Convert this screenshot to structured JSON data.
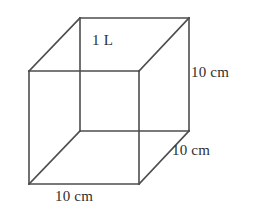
{
  "figure": {
    "name": "cube-volume-diagram",
    "background_color": "#ffffff",
    "line_color": "#4d4d4d",
    "text_color": "#2e2e2e"
  },
  "labels": {
    "volume": "1 L",
    "height": "10 cm",
    "depth": "10 cm",
    "width": "10 cm"
  },
  "geometry": {
    "front_face": {
      "top_left": [
        29,
        71
      ],
      "top_right": [
        139,
        71
      ],
      "bottom_right": [
        139,
        184
      ],
      "bottom_left": [
        29,
        184
      ]
    },
    "back_face": {
      "top_left": [
        80,
        18
      ],
      "top_right": [
        189,
        18
      ],
      "bottom_right": [
        189,
        131
      ],
      "bottom_left": [
        80,
        131
      ]
    }
  }
}
